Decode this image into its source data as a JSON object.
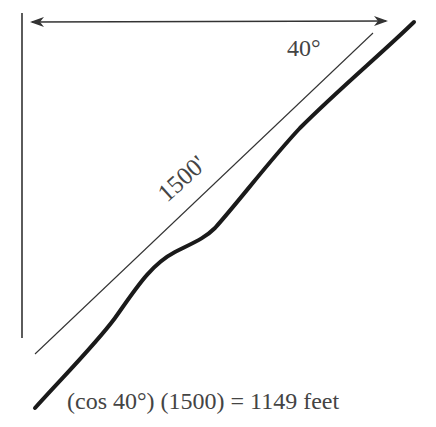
{
  "diagram": {
    "angle_label": "40°",
    "slope_length_label": "1500'",
    "formula": "(cos 40°) (1500) = 1149 feet",
    "colors": {
      "line": "#333333",
      "curve": "#1a1a1a",
      "text": "#444444",
      "background": "#ffffff"
    },
    "elements": {
      "vertical_reference_line": "vertical line on left",
      "horizontal_distance_arrow": "double-headed horizontal arrow",
      "slope_line": "thin straight line at 40°",
      "terrain_profile": "thick curved terrain line"
    }
  }
}
